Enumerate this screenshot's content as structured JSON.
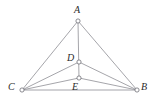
{
  "figure": {
    "canvas": {
      "width": 155,
      "height": 104,
      "background": "#ffffff"
    },
    "style": {
      "edge_color": "#8e8e94",
      "edge_width": 0.8,
      "marker_fill": "#ffffff",
      "marker_stroke": "#6f6f76",
      "label_color": "#2b2b2b"
    },
    "points": [
      {
        "id": "A",
        "label": "A",
        "x": 78,
        "y": 21,
        "label_x": 74,
        "label_y": 5
      },
      {
        "id": "B",
        "label": "B",
        "x": 137,
        "y": 90,
        "label_x": 141,
        "label_y": 82
      },
      {
        "id": "C",
        "label": "C",
        "x": 22,
        "y": 90,
        "label_x": 8,
        "label_y": 82
      },
      {
        "id": "D",
        "label": "D",
        "x": 79,
        "y": 62,
        "label_x": 67,
        "label_y": 53
      },
      {
        "id": "E",
        "label": "E",
        "x": 79,
        "y": 78,
        "label_x": 72,
        "label_y": 82
      }
    ],
    "edges": [
      {
        "id": "edge-A-C",
        "from": "A",
        "to": "C"
      },
      {
        "id": "edge-A-B",
        "from": "A",
        "to": "B"
      },
      {
        "id": "edge-A-E",
        "from": "A",
        "to": "E"
      },
      {
        "id": "edge-C-B",
        "from": "C",
        "to": "B"
      },
      {
        "id": "edge-C-D",
        "from": "C",
        "to": "D"
      },
      {
        "id": "edge-C-E",
        "from": "C",
        "to": "E"
      },
      {
        "id": "edge-B-D",
        "from": "B",
        "to": "D"
      },
      {
        "id": "edge-B-E",
        "from": "B",
        "to": "E"
      }
    ],
    "marker_radius": 2.1
  }
}
